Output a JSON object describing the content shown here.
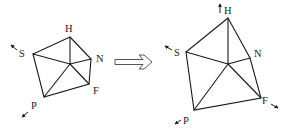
{
  "diagram": {
    "type": "transformation",
    "colors": {
      "stroke": "#1a1a1a",
      "arrow_outline": "#555555",
      "background": "#ffffff"
    },
    "before": {
      "labels": {
        "H": "H",
        "S": "S",
        "N": "N",
        "F": "F",
        "P": "P"
      },
      "motion_arrows": [
        "S",
        "P"
      ]
    },
    "transition_arrow": {
      "icon": "hollow-right-arrow"
    },
    "after": {
      "labels": {
        "H": "H",
        "S": "S",
        "N": "N",
        "F": "F",
        "P": "P"
      },
      "motion_arrows": [
        "H",
        "S",
        "F",
        "P"
      ]
    }
  }
}
